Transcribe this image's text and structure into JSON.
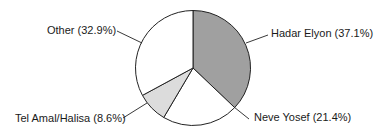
{
  "chart_data": {
    "type": "pie",
    "title": "",
    "start_angle_deg": 0,
    "direction": "clockwise",
    "slices": [
      {
        "name": "Hadar Elyon",
        "value": 37.1,
        "label": "Hadar Elyon (37.1%)",
        "color": "#a0a0a0"
      },
      {
        "name": "Neve Yosef",
        "value": 21.4,
        "label": "Neve Yosef (21.4%)",
        "color": "#ffffff"
      },
      {
        "name": "Tel Amal/Halisa",
        "value": 8.6,
        "label": "Tel Amal/Halisa (8.6%)",
        "color": "#dcdcdc"
      },
      {
        "name": "Other",
        "value": 32.9,
        "label": "Other (32.9%)",
        "color": "#ffffff"
      }
    ],
    "categories": [
      "Hadar Elyon",
      "Neve Yosef",
      "Tel Amal/Halisa",
      "Other"
    ],
    "values": [
      37.1,
      21.4,
      8.6,
      32.9
    ],
    "legend": "none (leader-line labels)"
  },
  "labels": {
    "hadar": "Hadar Elyon (37.1%)",
    "neve": "Neve Yosef (21.4%)",
    "telamal": "Tel Amal/Halisa (8.6%)",
    "other": "Other (32.9%)"
  }
}
